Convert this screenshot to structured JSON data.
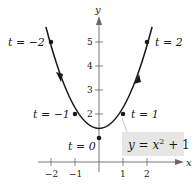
{
  "diagram": {
    "type": "parametric-curve",
    "equation_label": "y = x² + 1",
    "equation_parts": {
      "y": "y",
      "eq": " = ",
      "x": "x",
      "exp": "2",
      "rest": " + 1"
    },
    "axes": {
      "x_label": "x",
      "y_label": "y",
      "x_ticks": [
        {
          "value": -2,
          "label": "−2"
        },
        {
          "value": -1,
          "label": "−1"
        },
        {
          "value": 1,
          "label": "1"
        },
        {
          "value": 2,
          "label": "2"
        }
      ],
      "y_ticks": [
        {
          "value": 2,
          "label": "2"
        },
        {
          "value": 3,
          "label": "3"
        },
        {
          "value": 4,
          "label": "4"
        },
        {
          "value": 5,
          "label": "5"
        }
      ]
    },
    "points": [
      {
        "t": -2,
        "x": -2,
        "y": 5,
        "label": "t = −2"
      },
      {
        "t": -1,
        "x": -1,
        "y": 2,
        "label": "t = −1"
      },
      {
        "t": 0,
        "x": 0,
        "y": 1,
        "label": "t = 0"
      },
      {
        "t": 1,
        "x": 1,
        "y": 2,
        "label": "t = 1"
      },
      {
        "t": 2,
        "x": 2,
        "y": 5,
        "label": "t = 2"
      }
    ],
    "orientation_arrows": [
      "down on left branch",
      "up on right branch"
    ],
    "colors": {
      "curve": "#1a1a1a",
      "axis": "#555555",
      "label_box_fill": "#e6e6e6"
    }
  }
}
